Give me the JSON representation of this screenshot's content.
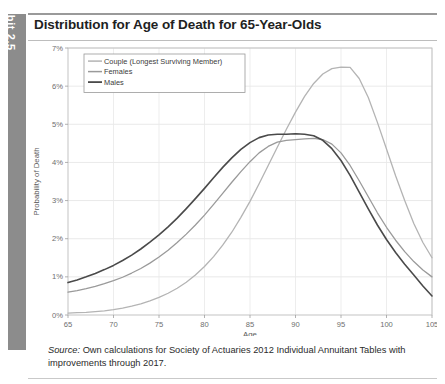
{
  "exhibit": {
    "tab_label": "Exhibit 2.5",
    "title": "Distribution for Age of Death for 65-Year-Olds",
    "tab_color": "#8c8c8c"
  },
  "source": {
    "prefix": "Source:",
    "text": " Own calculations for Society of Actuaries 2012 Individual Annuitant Tables with improvements through 2017."
  },
  "chart_data": {
    "type": "line",
    "title": "Distribution for Age of Death for 65-Year-Olds",
    "xlabel": "Age",
    "ylabel": "Probability of Death",
    "xlim": [
      65,
      105
    ],
    "ylim": [
      0,
      7
    ],
    "xticks": [
      65,
      70,
      75,
      80,
      85,
      90,
      95,
      100,
      105
    ],
    "xtick_labels": [
      "65",
      "70",
      "75",
      "80",
      "85",
      "90",
      "95",
      "100",
      "105"
    ],
    "yticks": [
      0,
      1,
      2,
      3,
      4,
      5,
      6,
      7
    ],
    "ytick_labels": [
      "0%",
      "1%",
      "2%",
      "3%",
      "4%",
      "5%",
      "6%",
      "7%"
    ],
    "grid": true,
    "legend_position": "upper-left",
    "x": [
      65,
      66,
      67,
      68,
      69,
      70,
      71,
      72,
      73,
      74,
      75,
      76,
      77,
      78,
      79,
      80,
      81,
      82,
      83,
      84,
      85,
      86,
      87,
      88,
      89,
      90,
      91,
      92,
      93,
      94,
      95,
      96,
      97,
      98,
      99,
      100,
      101,
      102,
      103,
      104,
      105
    ],
    "series": [
      {
        "name": "Couple (Longest Surviving Member)",
        "color": "#b4b4b4",
        "width": 1.3,
        "values": [
          0.05,
          0.06,
          0.07,
          0.09,
          0.11,
          0.14,
          0.18,
          0.23,
          0.29,
          0.37,
          0.46,
          0.57,
          0.7,
          0.86,
          1.05,
          1.27,
          1.53,
          1.83,
          2.17,
          2.56,
          2.98,
          3.44,
          3.92,
          4.4,
          4.87,
          5.32,
          5.73,
          6.07,
          6.32,
          6.46,
          6.5,
          6.49,
          6.2,
          5.7,
          5.05,
          4.35,
          3.65,
          3.0,
          2.4,
          1.9,
          1.5
        ]
      },
      {
        "name": "Females",
        "color": "#9a9a9a",
        "width": 1.3,
        "values": [
          0.6,
          0.64,
          0.69,
          0.75,
          0.82,
          0.9,
          0.99,
          1.1,
          1.22,
          1.36,
          1.52,
          1.7,
          1.9,
          2.12,
          2.36,
          2.62,
          2.9,
          3.19,
          3.48,
          3.76,
          4.02,
          4.25,
          4.42,
          4.53,
          4.58,
          4.6,
          4.62,
          4.63,
          4.6,
          4.48,
          4.25,
          3.92,
          3.52,
          3.1,
          2.68,
          2.3,
          1.96,
          1.66,
          1.4,
          1.18,
          1.0
        ]
      },
      {
        "name": "Males",
        "color": "#4a4a4a",
        "width": 1.6,
        "values": [
          0.85,
          0.92,
          1.0,
          1.09,
          1.19,
          1.3,
          1.43,
          1.57,
          1.73,
          1.91,
          2.1,
          2.31,
          2.54,
          2.79,
          3.05,
          3.32,
          3.6,
          3.87,
          4.12,
          4.34,
          4.52,
          4.65,
          4.72,
          4.74,
          4.74,
          4.75,
          4.74,
          4.7,
          4.58,
          4.36,
          4.05,
          3.66,
          3.22,
          2.78,
          2.36,
          1.98,
          1.64,
          1.33,
          1.05,
          0.76,
          0.5
        ]
      }
    ],
    "legend": [
      "Couple (Longest Surviving Member)",
      "Females",
      "Males"
    ]
  }
}
